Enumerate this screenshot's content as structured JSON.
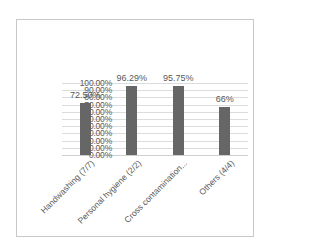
{
  "chart_data": {
    "type": "bar",
    "title": "",
    "xlabel": "",
    "ylabel": "",
    "categories": [
      "Handwashing (7/7)",
      "Personal hygiene (2/2)",
      "Cross contamination...",
      "Others (4/4)"
    ],
    "values": [
      72.5,
      96.29,
      95.75,
      66
    ],
    "data_labels": [
      "72.50%",
      "96.29%",
      "95.75%",
      "66%"
    ],
    "ylim": [
      0,
      100
    ],
    "yticks": [
      "0.00%",
      "10.00%",
      "20.00%",
      "30.00%",
      "40.00%",
      "50.00%",
      "60.00%",
      "70.00%",
      "80.00%",
      "90.00%",
      "100.00%"
    ],
    "grid": true,
    "legend": "none",
    "bar_color": "#666666"
  }
}
